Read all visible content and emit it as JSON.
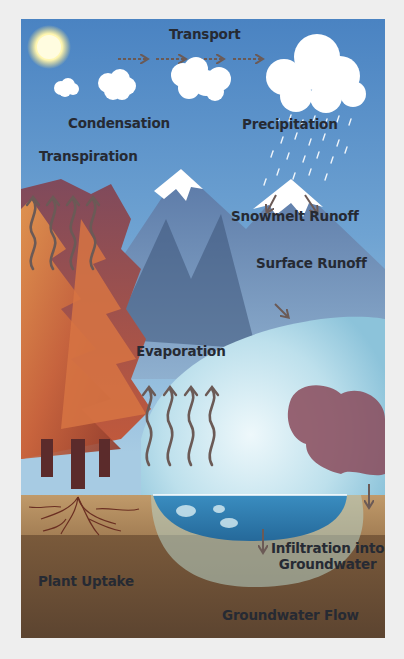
{
  "diagram": {
    "colors": {
      "sky_top": "#4f87c4",
      "sky_bottom": "#a9cde4",
      "mountain": "#5f7fa8",
      "mountain_dark": "#3d5478",
      "snow": "#ffffff",
      "tree_dark": "#8e3a2c",
      "tree_mid": "#c2603b",
      "tree_light": "#e58f48",
      "lake": "#2f7fb2",
      "water_light": "#b6dbe9",
      "soil_top": "#b58d5f",
      "soil_deep": "#6a4f35",
      "arrow": "#6b5a56",
      "label": "#262a33",
      "border": "#eeeeee"
    },
    "labels": {
      "transport": "Transport",
      "condensation": "Condensation",
      "precipitation": "Precipitation",
      "transpiration": "Transpiration",
      "snowmelt_runoff": "Snowmelt Runoff",
      "surface_runoff": "Surface Runoff",
      "evaporation": "Evaporation",
      "infiltration_line1": "Infiltration into",
      "infiltration_line2": "Groundwater",
      "plant_uptake": "Plant Uptake",
      "groundwater_flow": "Groundwater Flow"
    },
    "icons": [
      "sun-icon",
      "cloud-icon",
      "rain-icon",
      "arrow-icon",
      "wavy-arrow-icon",
      "tree-icon",
      "mountain-icon",
      "lake-icon",
      "roots-icon"
    ]
  }
}
